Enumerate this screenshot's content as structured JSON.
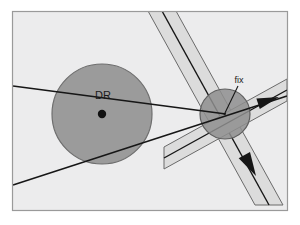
{
  "figure": {
    "kind": "navigation-fix-diagram",
    "canvas": {
      "width": 300,
      "height": 225
    },
    "frame": {
      "x": 12,
      "y": 11,
      "width": 276,
      "height": 200,
      "background": "#ececed",
      "border_color": "#9a9a9a",
      "border_width": 1.2
    },
    "outer_background": "#ffffff"
  },
  "colors": {
    "plot_background": "#ececed",
    "dr_circle_fill": "#9b9b9b",
    "dr_circle_stroke": "#6e6e6e",
    "fix_circle_fill": "#8e8e8e",
    "fix_circle_stroke": "#5f5f5f",
    "band_fill": "#dcdcdc",
    "band_stroke": "#6a6a6a",
    "line_color": "#161616",
    "text_color": "#1a1a1a",
    "center_dot": "#111111"
  },
  "labels": {
    "dr": {
      "text": "DR",
      "x": 103,
      "y": 99,
      "font_size": 11,
      "anchor": "middle"
    },
    "fix": {
      "text": "fix",
      "x": 239,
      "y": 83,
      "font_size": 9,
      "anchor": "middle"
    }
  },
  "dr_circle": {
    "name": "dr-uncertainty-circle",
    "cx": 102,
    "cy": 114,
    "r": 50,
    "center_dot_r": 4.2
  },
  "fix_circle": {
    "name": "fix-uncertainty-circle",
    "cx": 225,
    "cy": 114,
    "r": 25
  },
  "bands": [
    {
      "name": "steep-lop-band",
      "description": "steep line-of-position band running upper-left to lower-right",
      "corners": [
        [
          148,
          11
        ],
        [
          176,
          11
        ],
        [
          283,
          205
        ],
        [
          255,
          205
        ]
      ],
      "center_line": {
        "x1": 162,
        "y1": 11,
        "x2": 269,
        "y2": 205
      }
    },
    {
      "name": "shallow-lop-band",
      "description": "shallow line-of-position band running lower-left to right edge",
      "corners": [
        [
          164,
          147
        ],
        [
          287,
          79
        ],
        [
          287,
          101
        ],
        [
          164,
          169
        ]
      ],
      "center_line": {
        "x1": 164,
        "y1": 158,
        "x2": 287,
        "y2": 90
      }
    }
  ],
  "lines": [
    {
      "name": "dr-course-line-upper",
      "description": "course line from left frame edge through DR centre to fix",
      "x1": 13,
      "y1": 86,
      "x2": 226,
      "y2": 114
    },
    {
      "name": "dr-course-line-lower",
      "description": "line from lower-left frame edge to right frame edge through fix",
      "x1": 13,
      "y1": 185,
      "x2": 287,
      "y2": 96
    },
    {
      "name": "fix-leader-line",
      "description": "leader line from fix label to fix point",
      "x1": 238,
      "y1": 86,
      "x2": 224,
      "y2": 115
    }
  ],
  "arrows": [
    {
      "name": "east-course-arrow",
      "direction": "right",
      "tip_x": 279,
      "tip_y": 97,
      "angle_deg": -18,
      "length": 22,
      "half_width": 5.5
    },
    {
      "name": "south-lop-arrow",
      "direction": "down-right",
      "tip_x": 256,
      "tip_y": 176,
      "angle_deg": 61,
      "length": 24,
      "half_width": 6.5
    }
  ]
}
